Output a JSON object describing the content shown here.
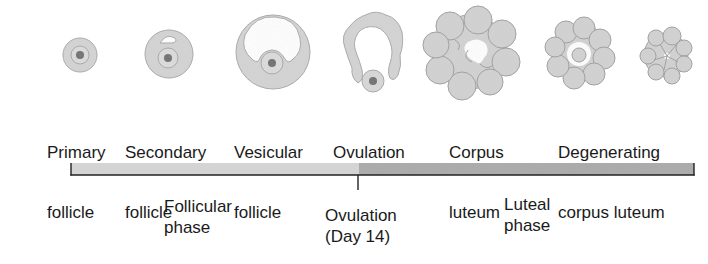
{
  "stages": [
    {
      "id": "primary",
      "line1": "Primary",
      "line2": "follicle"
    },
    {
      "id": "secondary",
      "line1": "Secondary",
      "line2": "follicle"
    },
    {
      "id": "vesicular",
      "line1": "Vesicular",
      "line2": "follicle"
    },
    {
      "id": "ovulation",
      "line1": "Ovulation",
      "line2": ""
    },
    {
      "id": "corpus-luteum",
      "line1": "Corpus",
      "line2": "luteum"
    },
    {
      "id": "degenerating",
      "line1": "Degenerating",
      "line2": "corpus luteum"
    }
  ],
  "timeline": {
    "follicular_color": "#d6d6d6",
    "luteal_color": "#a9a9a9",
    "axis_color": "#222222",
    "marker": {
      "line1": "Ovulation",
      "line2": "(Day 14)"
    },
    "phases": [
      {
        "line1": "Follicular",
        "line2": "phase"
      },
      {
        "line1": "Luteal",
        "line2": "phase"
      }
    ]
  },
  "colors": {
    "tissue": "#d4d4d4",
    "tissue_edge": "#a8a8a8",
    "oocyte": "#e0e0e0",
    "nucleus": "#6a6a6a"
  }
}
